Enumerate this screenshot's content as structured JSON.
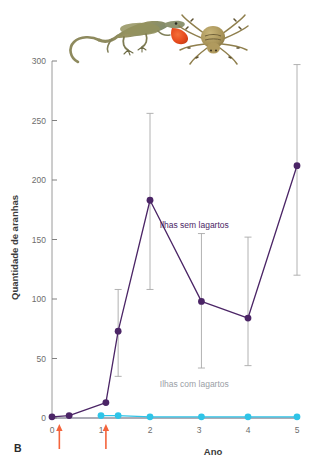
{
  "figure": {
    "panel_label": "B",
    "accent_purple": "#4b2566",
    "accent_cyan": "#2ec4e8",
    "arrow_color": "#f4643c",
    "tick_color": "#808080",
    "axis_color": "#9a9a9a"
  },
  "images": {
    "lizard": {
      "name": "anole-lizard-photo",
      "alt": "Anole lizard with orange dewlap extended",
      "body_color": "#8b8354",
      "dewlap_color": "#e8522a"
    },
    "spider": {
      "name": "spider-photo",
      "alt": "Tan spider with banded legs",
      "body_color": "#a8935c",
      "leg_color": "#8a7a4a"
    }
  },
  "chart_data": {
    "type": "line",
    "title": "",
    "xlabel": "Ano",
    "ylabel": "Quantidade de aranhas",
    "xlim": [
      0,
      5
    ],
    "ylim": [
      0,
      300
    ],
    "xticks": [
      0,
      1,
      2,
      3,
      4,
      5
    ],
    "xtick_labels": [
      "0",
      "1",
      "2",
      "3",
      "4",
      "5"
    ],
    "yticks": [
      0,
      50,
      100,
      150,
      200,
      250,
      300
    ],
    "ytick_labels": [
      "0",
      "50",
      "100",
      "150",
      "200",
      "250",
      "300"
    ],
    "grid": false,
    "legend_position": "inline-annotation",
    "series": [
      {
        "name": "Ilhas sem lagartos",
        "color": "#4b2566",
        "label_color": "#4b2566",
        "x": [
          0,
          0.35,
          1.1,
          1.35,
          2.0,
          3.05,
          4.0,
          5.0
        ],
        "values": [
          1,
          2,
          13,
          73,
          183,
          98,
          84,
          212
        ],
        "err_low": [
          1,
          2,
          13,
          35,
          108,
          42,
          44,
          120
        ],
        "err_high": [
          1,
          2,
          13,
          108,
          256,
          155,
          152,
          297
        ]
      },
      {
        "name": "Ilhas com lagartos",
        "color": "#2ec4e8",
        "label_color": "#9aa0a6",
        "x": [
          1.0,
          1.35,
          2.0,
          3.05,
          4.0,
          5.0
        ],
        "values": [
          2,
          2,
          1,
          1,
          1,
          1
        ],
        "err_low": [
          2,
          2,
          1,
          1,
          1,
          1
        ],
        "err_high": [
          2,
          2,
          1,
          1,
          1,
          1
        ]
      }
    ],
    "annotations": [
      {
        "text": "Ilhas sem lagartos",
        "x": 2.2,
        "y": 160,
        "color": "#4b2566"
      },
      {
        "text": "Ilhas com lagartos",
        "x": 2.2,
        "y": 26,
        "color": "#9aa0a6"
      }
    ],
    "arrows": [
      {
        "x": 0.15,
        "name": "intro-arrow-1"
      },
      {
        "x": 1.1,
        "name": "intro-arrow-2"
      }
    ]
  }
}
